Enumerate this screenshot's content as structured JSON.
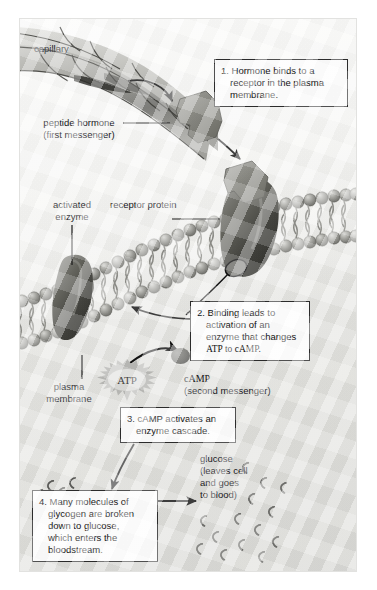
{
  "figure": {
    "background_color": "#ffffff",
    "panel_color": "#e9e9e6"
  },
  "labels": {
    "capillary": "capillary",
    "peptide_hormone_line1": "peptide hormone",
    "peptide_hormone_line2": "(first messenger)",
    "activated_enzyme_line1": "activated",
    "activated_enzyme_line2": "enzyme",
    "receptor_protein": "receptor protein",
    "plasma_membrane_line1": "plasma",
    "plasma_membrane_line2": "membrane",
    "atp": "ATP",
    "camp_line1": "cAMP",
    "camp_line2": "(second messenger)",
    "glycogen": "glycogen",
    "glucose_line1": "glucose",
    "glucose_line2": "(leaves cell",
    "glucose_line3": "and goes",
    "glucose_line4": "to blood)"
  },
  "steps": [
    {
      "number": "1.",
      "lines": [
        "1. Hormone binds to a",
        "receptor in the plasma",
        "membrane."
      ]
    },
    {
      "number": "2.",
      "lines": [
        "2. Binding leads to",
        "activation of an",
        "enzyme that changes",
        "ATP to cAMP."
      ]
    },
    {
      "number": "3.",
      "lines": [
        "3. cAMP activates an",
        "enzyme cascade."
      ]
    },
    {
      "number": "4.",
      "lines": [
        "4. Many molecules of",
        "glycogen are broken",
        "down to glucose,",
        "which enters the",
        "bloodstream."
      ]
    }
  ],
  "colors": {
    "text": "#16161a",
    "box_border": "#2a2a2a",
    "box_fill": "#fdfdfd",
    "leader_line": "#1a1a1a",
    "membrane_head": "#9a9a96",
    "protein_dark": "#4a4a48",
    "hormone_fill": "#8c8c88"
  }
}
